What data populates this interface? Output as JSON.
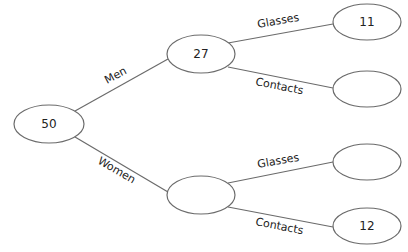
{
  "diagram": {
    "type": "tree",
    "nodes": [
      {
        "id": "root",
        "value": "50",
        "cx": 49,
        "cy": 124,
        "rx": 35,
        "ry": 19
      },
      {
        "id": "men",
        "value": "27",
        "cx": 201,
        "cy": 54,
        "rx": 34,
        "ry": 19
      },
      {
        "id": "women",
        "value": "",
        "cx": 201,
        "cy": 195,
        "rx": 34,
        "ry": 19
      },
      {
        "id": "men-glasses",
        "value": "11",
        "cx": 367,
        "cy": 22,
        "rx": 34,
        "ry": 18
      },
      {
        "id": "men-contacts",
        "value": "",
        "cx": 367,
        "cy": 89,
        "rx": 34,
        "ry": 18
      },
      {
        "id": "women-glasses",
        "value": "",
        "cx": 367,
        "cy": 162,
        "rx": 34,
        "ry": 18
      },
      {
        "id": "women-contacts",
        "value": "12",
        "cx": 367,
        "cy": 226,
        "rx": 34,
        "ry": 18
      }
    ],
    "edges": [
      {
        "from": "root",
        "to": "men",
        "label": "Men"
      },
      {
        "from": "root",
        "to": "women",
        "label": "Women"
      },
      {
        "from": "men",
        "to": "men-glasses",
        "label": "Glasses"
      },
      {
        "from": "men",
        "to": "men-contacts",
        "label": "Contacts"
      },
      {
        "from": "women",
        "to": "women-glasses",
        "label": "Glasses"
      },
      {
        "from": "women",
        "to": "women-contacts",
        "label": "Contacts"
      }
    ]
  }
}
